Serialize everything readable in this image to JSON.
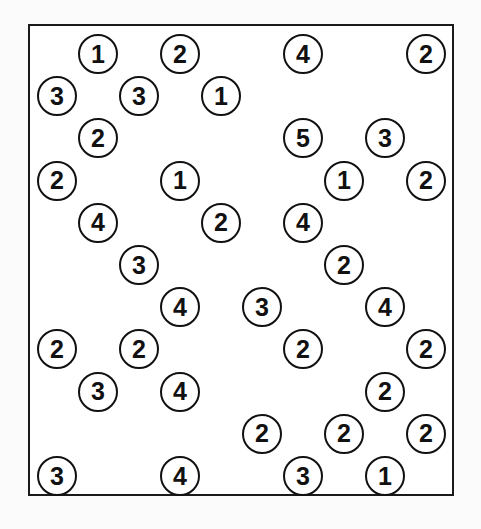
{
  "puzzle": {
    "type": "hashiwokakero",
    "columns": 10,
    "rows": 11,
    "islands": [
      {
        "row": 0,
        "col": 1,
        "value": "1"
      },
      {
        "row": 0,
        "col": 3,
        "value": "2"
      },
      {
        "row": 0,
        "col": 6,
        "value": "4"
      },
      {
        "row": 0,
        "col": 9,
        "value": "2"
      },
      {
        "row": 1,
        "col": 0,
        "value": "3"
      },
      {
        "row": 1,
        "col": 2,
        "value": "3"
      },
      {
        "row": 1,
        "col": 4,
        "value": "1"
      },
      {
        "row": 2,
        "col": 1,
        "value": "2"
      },
      {
        "row": 2,
        "col": 6,
        "value": "5"
      },
      {
        "row": 2,
        "col": 8,
        "value": "3"
      },
      {
        "row": 3,
        "col": 0,
        "value": "2"
      },
      {
        "row": 3,
        "col": 3,
        "value": "1"
      },
      {
        "row": 3,
        "col": 7,
        "value": "1"
      },
      {
        "row": 3,
        "col": 9,
        "value": "2"
      },
      {
        "row": 4,
        "col": 1,
        "value": "4"
      },
      {
        "row": 4,
        "col": 4,
        "value": "2"
      },
      {
        "row": 4,
        "col": 6,
        "value": "4"
      },
      {
        "row": 5,
        "col": 2,
        "value": "3"
      },
      {
        "row": 5,
        "col": 7,
        "value": "2"
      },
      {
        "row": 6,
        "col": 3,
        "value": "4"
      },
      {
        "row": 6,
        "col": 5,
        "value": "3"
      },
      {
        "row": 6,
        "col": 8,
        "value": "4"
      },
      {
        "row": 7,
        "col": 0,
        "value": "2"
      },
      {
        "row": 7,
        "col": 2,
        "value": "2"
      },
      {
        "row": 7,
        "col": 6,
        "value": "2"
      },
      {
        "row": 7,
        "col": 9,
        "value": "2"
      },
      {
        "row": 8,
        "col": 1,
        "value": "3"
      },
      {
        "row": 8,
        "col": 3,
        "value": "4"
      },
      {
        "row": 8,
        "col": 8,
        "value": "2"
      },
      {
        "row": 9,
        "col": 5,
        "value": "2"
      },
      {
        "row": 9,
        "col": 7,
        "value": "2"
      },
      {
        "row": 9,
        "col": 9,
        "value": "2"
      },
      {
        "row": 10,
        "col": 0,
        "value": "3"
      },
      {
        "row": 10,
        "col": 3,
        "value": "4"
      },
      {
        "row": 10,
        "col": 6,
        "value": "3"
      },
      {
        "row": 10,
        "col": 8,
        "value": "1"
      }
    ]
  }
}
